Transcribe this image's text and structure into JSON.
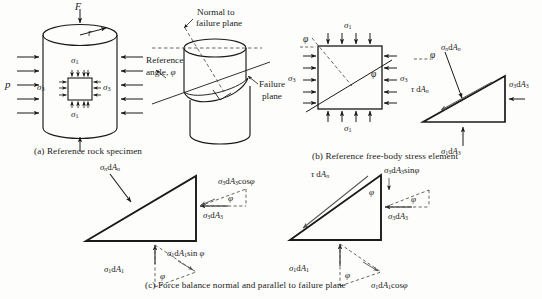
{
  "figure": {
    "captions": {
      "a": "(a) Reference rock specimen",
      "b": "(b) Reference free-body stress element",
      "c": "(c) Force balance normal and parallel to failure plane"
    }
  },
  "panel_a": {
    "axial_load": "F",
    "radius": "r",
    "confining_pressure": "p",
    "sigma1_top": "σ1",
    "sigma1_bottom": "σ1",
    "sigma3_left": "σ3",
    "sigma3_right": "σ3",
    "normal_label_line1": "Normal to",
    "normal_label_line2": "failure plane",
    "reference_angle_line1": "Reference",
    "reference_angle_line2": "angle, φ",
    "failure_plane_line1": "Failure",
    "failure_plane_line2": "plane"
  },
  "panel_b": {
    "sigma1_top": "σ1",
    "sigma1_bottom": "σ1",
    "sigma3_left": "σ3",
    "sigma3_right": "σ3",
    "phi_top_left": "φ",
    "phi_inside": "φ",
    "triangle": {
      "phi": "φ",
      "sigma_n_dAn": "σn dAn",
      "tau_dAn": "τ dAn",
      "sigma3_dA3": "σ3 dA3",
      "sigma1_dA1": "σ1 dA3"
    }
  },
  "panel_c_left": {
    "sigma_n_dAn": "σn dAn",
    "sigma3_dA3_cos": "σ3 dA3 cos φ",
    "sigma3_dA3": "σ3 dA3",
    "phi_right": "φ",
    "sigma1_dA1_sin": "σ1 dA1 sin φ",
    "sigma1_dA1": "σ1 dA1",
    "phi_bottom": "φ"
  },
  "panel_c_right": {
    "tau_dAn": "τ dAn",
    "sigma3_dA3_sin": "σ3 dA3 sin φ",
    "sigma3_dA3": "σ3 dA3",
    "phi_vertical": "φ",
    "phi_right": "φ",
    "sigma1_dA1": "σ1 dA1",
    "sigma1_dA1_cos": "σ1 dA1 cos φ",
    "phi_bottom": "φ"
  },
  "colors": {
    "ink": "#1a1a1a",
    "paper": "#fdfdfb",
    "dashed": "#555555"
  }
}
